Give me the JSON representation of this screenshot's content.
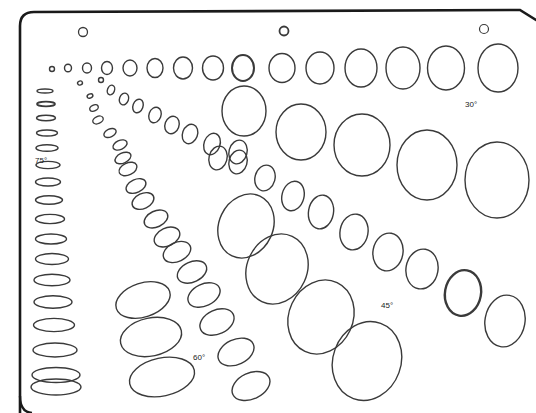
{
  "template": {
    "stroke_color": "#3a3a3a",
    "frame_color": "#1a1a1a",
    "background": "#ffffff",
    "labels": [
      {
        "id": "label-30",
        "text": "30°",
        "x": 465,
        "y": 107
      },
      {
        "id": "label-75",
        "text": "75°",
        "x": 35,
        "y": 163
      },
      {
        "id": "label-45",
        "text": "45°",
        "x": 381,
        "y": 308
      },
      {
        "id": "label-60",
        "text": "60°",
        "x": 193,
        "y": 360
      }
    ],
    "holes": [
      {
        "cx": 83,
        "cy": 32,
        "rx": 4.5,
        "ry": 4.5,
        "w": 1.3
      },
      {
        "cx": 284,
        "cy": 31,
        "rx": 4.5,
        "ry": 4.5,
        "w": 1.8
      },
      {
        "cx": 484,
        "cy": 29,
        "rx": 4.5,
        "ry": 4.5,
        "w": 1.2
      }
    ],
    "rows": {
      "circles_top": [
        {
          "cx": 52,
          "cy": 69,
          "rx": 2.5,
          "ry": 2.5
        },
        {
          "cx": 68,
          "cy": 68,
          "rx": 3.5,
          "ry": 3.8
        },
        {
          "cx": 87,
          "cy": 68,
          "rx": 4.5,
          "ry": 5
        },
        {
          "cx": 107,
          "cy": 68,
          "rx": 5.5,
          "ry": 6.5
        },
        {
          "cx": 130,
          "cy": 68,
          "rx": 7,
          "ry": 8
        },
        {
          "cx": 155,
          "cy": 68,
          "rx": 8,
          "ry": 9.5
        },
        {
          "cx": 183,
          "cy": 68,
          "rx": 9.5,
          "ry": 11
        },
        {
          "cx": 213,
          "cy": 68,
          "rx": 10.5,
          "ry": 12
        },
        {
          "cx": 243,
          "cy": 68,
          "rx": 11,
          "ry": 13,
          "w": 2
        },
        {
          "cx": 282,
          "cy": 68,
          "rx": 13,
          "ry": 14.5
        },
        {
          "cx": 320,
          "cy": 68,
          "rx": 14,
          "ry": 16
        },
        {
          "cx": 361,
          "cy": 68,
          "rx": 16,
          "ry": 19
        },
        {
          "cx": 403,
          "cy": 68,
          "rx": 17,
          "ry": 21
        },
        {
          "cx": 446,
          "cy": 68,
          "rx": 18.5,
          "ry": 22
        },
        {
          "cx": 498,
          "cy": 68,
          "rx": 20,
          "ry": 24
        }
      ],
      "row_30": [
        {
          "cx": 244,
          "cy": 111,
          "rx": 22,
          "ry": 25,
          "rot": 0
        },
        {
          "cx": 301,
          "cy": 132,
          "rx": 25,
          "ry": 28,
          "rot": 0
        },
        {
          "cx": 362,
          "cy": 145,
          "rx": 28,
          "ry": 31,
          "rot": 0
        },
        {
          "cx": 427,
          "cy": 165,
          "rx": 30,
          "ry": 35,
          "rot": 0
        },
        {
          "cx": 497,
          "cy": 180,
          "rx": 32,
          "ry": 38,
          "rot": 0
        }
      ],
      "row_45_small": [
        {
          "cx": 80,
          "cy": 83,
          "rx": 2.5,
          "ry": 2,
          "rot": -20
        },
        {
          "cx": 101,
          "cy": 80,
          "rx": 2.5,
          "ry": 2.5,
          "rot": 0
        },
        {
          "cx": 111,
          "cy": 90,
          "rx": 3.5,
          "ry": 5,
          "rot": 20
        },
        {
          "cx": 124,
          "cy": 99,
          "rx": 4.5,
          "ry": 6,
          "rot": 20
        },
        {
          "cx": 138,
          "cy": 106,
          "rx": 5,
          "ry": 7,
          "rot": 20
        },
        {
          "cx": 155,
          "cy": 115,
          "rx": 6,
          "ry": 8,
          "rot": 20
        },
        {
          "cx": 172,
          "cy": 125,
          "rx": 7,
          "ry": 9,
          "rot": 20
        },
        {
          "cx": 190,
          "cy": 134,
          "rx": 7.5,
          "ry": 10,
          "rot": 20
        },
        {
          "cx": 212,
          "cy": 144,
          "rx": 8,
          "ry": 11,
          "rot": 20
        },
        {
          "cx": 238,
          "cy": 152,
          "rx": 9,
          "ry": 12,
          "rot": 15
        }
      ],
      "row_45_large": [
        {
          "cx": 218,
          "cy": 158,
          "rx": 9,
          "ry": 12,
          "rot": 15
        },
        {
          "cx": 238,
          "cy": 162,
          "rx": 9,
          "ry": 12,
          "rot": 15
        },
        {
          "cx": 265,
          "cy": 178,
          "rx": 10,
          "ry": 13,
          "rot": 15
        },
        {
          "cx": 293,
          "cy": 196,
          "rx": 11,
          "ry": 15,
          "rot": 15
        },
        {
          "cx": 321,
          "cy": 212,
          "rx": 12.5,
          "ry": 17,
          "rot": 10
        },
        {
          "cx": 354,
          "cy": 232,
          "rx": 14,
          "ry": 18,
          "rot": 10
        },
        {
          "cx": 388,
          "cy": 252,
          "rx": 15,
          "ry": 19,
          "rot": 10
        },
        {
          "cx": 422,
          "cy": 269,
          "rx": 16,
          "ry": 20,
          "rot": 10
        },
        {
          "cx": 463,
          "cy": 293,
          "rx": 18,
          "ry": 23,
          "rot": 10,
          "w": 2.4
        },
        {
          "cx": 505,
          "cy": 321,
          "rx": 20,
          "ry": 26,
          "rot": 10
        }
      ],
      "row_60": [
        {
          "cx": 90,
          "cy": 96,
          "rx": 3,
          "ry": 2,
          "rot": -25
        },
        {
          "cx": 94,
          "cy": 108,
          "rx": 4.5,
          "ry": 3,
          "rot": -25
        },
        {
          "cx": 98,
          "cy": 120,
          "rx": 5.5,
          "ry": 3.5,
          "rot": -25
        },
        {
          "cx": 110,
          "cy": 133,
          "rx": 6.5,
          "ry": 4,
          "rot": -25
        },
        {
          "cx": 120,
          "cy": 145,
          "rx": 7.5,
          "ry": 4.5,
          "rot": -25
        },
        {
          "cx": 123,
          "cy": 158,
          "rx": 8.5,
          "ry": 5,
          "rot": -25
        },
        {
          "cx": 128,
          "cy": 169,
          "rx": 9.5,
          "ry": 6,
          "rot": -25
        },
        {
          "cx": 136,
          "cy": 186,
          "rx": 10.5,
          "ry": 6.5,
          "rot": -25
        },
        {
          "cx": 143,
          "cy": 201,
          "rx": 11.5,
          "ry": 7.5,
          "rot": -25
        },
        {
          "cx": 156,
          "cy": 219,
          "rx": 12.5,
          "ry": 8,
          "rot": -25
        },
        {
          "cx": 167,
          "cy": 237,
          "rx": 13.5,
          "ry": 9,
          "rot": -25
        },
        {
          "cx": 177,
          "cy": 252,
          "rx": 14.5,
          "ry": 9.5,
          "rot": -25
        },
        {
          "cx": 192,
          "cy": 272,
          "rx": 15.5,
          "ry": 10,
          "rot": -25
        },
        {
          "cx": 204,
          "cy": 295,
          "rx": 17,
          "ry": 11,
          "rot": -25
        },
        {
          "cx": 217,
          "cy": 322,
          "rx": 18,
          "ry": 12,
          "rot": -25
        },
        {
          "cx": 236,
          "cy": 352,
          "rx": 19,
          "ry": 12.5,
          "rot": -25
        },
        {
          "cx": 251,
          "cy": 386,
          "rx": 20,
          "ry": 13,
          "rot": -25
        }
      ],
      "row_60_large": [
        {
          "cx": 143,
          "cy": 300,
          "rx": 28,
          "ry": 17,
          "rot": -18
        },
        {
          "cx": 151,
          "cy": 337,
          "rx": 31,
          "ry": 19,
          "rot": -12
        },
        {
          "cx": 162,
          "cy": 377,
          "rx": 33,
          "ry": 19,
          "rot": -12
        }
      ],
      "row_45_big": [
        {
          "cx": 246,
          "cy": 226,
          "rx": 27,
          "ry": 33,
          "rot": 25
        },
        {
          "cx": 277,
          "cy": 269,
          "rx": 30,
          "ry": 36,
          "rot": 25
        },
        {
          "cx": 321,
          "cy": 317,
          "rx": 32,
          "ry": 38,
          "rot": 25
        },
        {
          "cx": 367,
          "cy": 361,
          "rx": 34,
          "ry": 40,
          "rot": 20
        }
      ],
      "row_75": [
        {
          "cx": 45,
          "cy": 91,
          "rx": 8,
          "ry": 2
        },
        {
          "cx": 46,
          "cy": 104,
          "rx": 9,
          "ry": 2.3,
          "w": 1.8
        },
        {
          "cx": 46,
          "cy": 118,
          "rx": 9.5,
          "ry": 2.7
        },
        {
          "cx": 47,
          "cy": 133,
          "rx": 10.5,
          "ry": 3
        },
        {
          "cx": 47,
          "cy": 148,
          "rx": 11,
          "ry": 3.3
        },
        {
          "cx": 48,
          "cy": 165,
          "rx": 12,
          "ry": 3.6
        },
        {
          "cx": 48,
          "cy": 182,
          "rx": 12.5,
          "ry": 4
        },
        {
          "cx": 49,
          "cy": 200,
          "rx": 13.5,
          "ry": 4.3
        },
        {
          "cx": 50,
          "cy": 219,
          "rx": 14.5,
          "ry": 4.6
        },
        {
          "cx": 51,
          "cy": 239,
          "rx": 15.5,
          "ry": 5
        },
        {
          "cx": 52,
          "cy": 259,
          "rx": 16.5,
          "ry": 5.5
        },
        {
          "cx": 52,
          "cy": 280,
          "rx": 18,
          "ry": 5.8
        },
        {
          "cx": 53,
          "cy": 302,
          "rx": 19,
          "ry": 6.2
        },
        {
          "cx": 54,
          "cy": 325,
          "rx": 20.5,
          "ry": 6.6
        },
        {
          "cx": 55,
          "cy": 350,
          "rx": 22,
          "ry": 7
        },
        {
          "cx": 56,
          "cy": 375,
          "rx": 24,
          "ry": 7.5
        },
        {
          "cx": 56,
          "cy": 387,
          "rx": 25,
          "ry": 8
        }
      ]
    }
  }
}
